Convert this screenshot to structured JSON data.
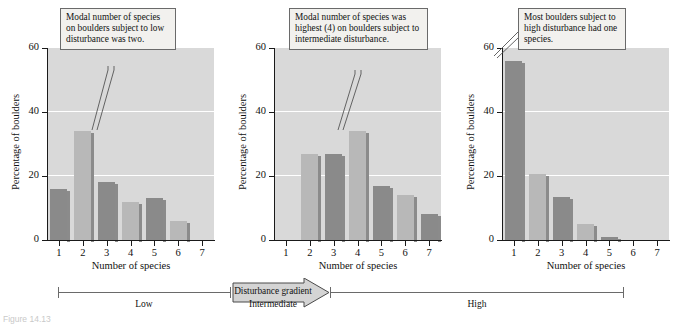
{
  "figure": {
    "caption": "Figure 14.13",
    "ylabel": "Percentage of boulders",
    "xlabel": "Number of species",
    "y_ticks": [
      "0",
      "20",
      "40",
      "60"
    ],
    "x_ticks": [
      "1",
      "2",
      "3",
      "4",
      "5",
      "6",
      "7"
    ],
    "colors": {
      "plot_background": "#d9d9d9",
      "gridline": "#ffffff",
      "bar_dark": "#8a8a8a",
      "bar_light": "#b8b8b8",
      "bar_side": "#8b8b8b",
      "axis": "#1a1a1a",
      "callout_background": "#f2f1ee",
      "callout_border": "#6a6a6a"
    }
  },
  "callouts": [
    {
      "text": "Modal number of species on boulders subject to low disturbance was two."
    },
    {
      "text": "Modal number of species was highest (4) on boulders subject to intermediate disturbance."
    },
    {
      "text": "Most boulders subject to high disturbance had one species."
    }
  ],
  "gradient": {
    "arrow_label": "Disturbance gradient",
    "segments": [
      {
        "label": "Low"
      },
      {
        "label": "Intermediate"
      },
      {
        "label": "High"
      }
    ]
  },
  "chart_data": [
    {
      "type": "bar",
      "title": "Low disturbance",
      "categories": [
        "1",
        "2",
        "3",
        "4",
        "5",
        "6",
        "7"
      ],
      "values": [
        16,
        34,
        18,
        12,
        13,
        6,
        0
      ],
      "xlabel": "Number of species",
      "ylabel": "Percentage of boulders",
      "ylim": [
        0,
        60
      ],
      "yticks": [
        0,
        20,
        40,
        60
      ],
      "grid": true,
      "legend": "none"
    },
    {
      "type": "bar",
      "title": "Intermediate disturbance",
      "categories": [
        "1",
        "2",
        "3",
        "4",
        "5",
        "6",
        "7"
      ],
      "values": [
        0,
        27,
        27,
        34,
        17,
        14,
        8
      ],
      "xlabel": "Number of species",
      "ylabel": "Percentage of boulders",
      "ylim": [
        0,
        60
      ],
      "yticks": [
        0,
        20,
        40,
        60
      ],
      "grid": true,
      "legend": "none"
    },
    {
      "type": "bar",
      "title": "High disturbance",
      "categories": [
        "1",
        "2",
        "3",
        "4",
        "5",
        "6",
        "7"
      ],
      "values": [
        56,
        20.5,
        13.5,
        5,
        1,
        0,
        0
      ],
      "xlabel": "Number of species",
      "ylabel": "Percentage of boulders",
      "ylim": [
        0,
        60
      ],
      "yticks": [
        0,
        20,
        40,
        60
      ],
      "grid": true,
      "legend": "none"
    }
  ]
}
